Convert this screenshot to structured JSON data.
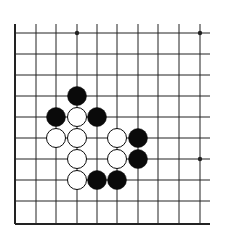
{
  "board": {
    "title": "Go problem diagram",
    "colors": {
      "line": "#222222",
      "black": "#0a0a0a",
      "white": "#ffffff",
      "background": "#ffffff"
    },
    "grid": {
      "x": [
        15,
        36,
        56,
        77,
        97,
        117,
        138,
        158,
        179,
        200
      ],
      "y": [
        33,
        54,
        75,
        96,
        117,
        138,
        159,
        180,
        201,
        222
      ],
      "right_extent": 210,
      "top_extent": 24,
      "edges": {
        "left": true,
        "bottom": true,
        "top": false,
        "right": false
      }
    },
    "star_points": [
      {
        "col": 3,
        "row": 0
      },
      {
        "col": 9,
        "row": 0
      },
      {
        "col": 9,
        "row": 6
      }
    ],
    "stones": [
      {
        "color": "black",
        "col": 3,
        "row": 3
      },
      {
        "color": "black",
        "col": 2,
        "row": 4
      },
      {
        "color": "white",
        "col": 3,
        "row": 4
      },
      {
        "color": "black",
        "col": 4,
        "row": 4
      },
      {
        "color": "white",
        "col": 2,
        "row": 5
      },
      {
        "color": "white",
        "col": 3,
        "row": 5
      },
      {
        "color": "white",
        "col": 5,
        "row": 5
      },
      {
        "color": "black",
        "col": 6,
        "row": 5
      },
      {
        "color": "white",
        "col": 3,
        "row": 6
      },
      {
        "color": "white",
        "col": 5,
        "row": 6
      },
      {
        "color": "black",
        "col": 6,
        "row": 6
      },
      {
        "color": "white",
        "col": 3,
        "row": 7
      },
      {
        "color": "black",
        "col": 4,
        "row": 7
      },
      {
        "color": "black",
        "col": 5,
        "row": 7
      }
    ],
    "stone_radius": 9.5
  }
}
